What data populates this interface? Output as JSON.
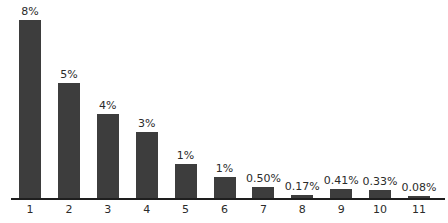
{
  "chart_data": {
    "type": "bar",
    "title": "",
    "xlabel": "",
    "ylabel": "",
    "categories": [
      "1",
      "2",
      "3",
      "4",
      "5",
      "6",
      "7",
      "8",
      "9",
      "10",
      "11"
    ],
    "values": [
      8,
      5,
      4,
      3,
      1,
      1,
      0.5,
      0.17,
      0.41,
      0.33,
      0.08
    ],
    "labels": [
      "8%",
      "5%",
      "4%",
      "3%",
      "1%",
      "1%",
      "0.50%",
      "0.17%",
      "0.41%",
      "0.33%",
      "0.08%"
    ],
    "bar_tops_px": [
      20,
      83,
      114,
      132,
      164,
      177,
      187,
      195,
      189,
      190,
      196
    ],
    "grid": false,
    "legend": null,
    "y_axis_visible": false,
    "bar_color": "#3d3d3d"
  }
}
